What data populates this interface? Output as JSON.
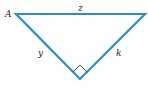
{
  "diagram": {
    "type": "right-triangle",
    "stroke_color": "#2a8fc7",
    "marker_color": "#333333",
    "vertices": {
      "A": [
        16,
        14
      ],
      "top_right": [
        145,
        14
      ],
      "bottom": [
        80,
        79
      ]
    },
    "labels": {
      "vertex_A": "A",
      "side_top": "z",
      "side_left": "y",
      "side_right": "k"
    },
    "right_angle_at": "bottom"
  }
}
